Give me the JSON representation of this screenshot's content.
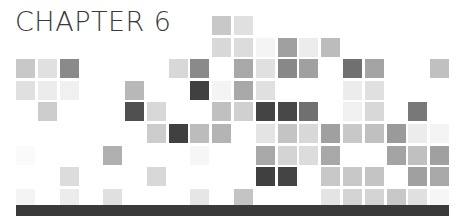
{
  "title": "CHAPTER 6",
  "bar_color": "#3a3a3a",
  "grid": {
    "origin_x": 16,
    "origin_y": 16,
    "pitch_x": 21.8,
    "pitch_y": 21.6,
    "columns": 20,
    "rows": 9,
    "cells": [
      {
        "r": 0,
        "c": 9,
        "color": "#c8c8c8"
      },
      {
        "r": 0,
        "c": 10,
        "color": "#e0e0e0"
      },
      {
        "r": 1,
        "c": 9,
        "color": "#d8d8d8"
      },
      {
        "r": 1,
        "c": 10,
        "color": "#dcdcdc"
      },
      {
        "r": 1,
        "c": 11,
        "color": "#f4f4f4"
      },
      {
        "r": 1,
        "c": 12,
        "color": "#a0a0a0"
      },
      {
        "r": 1,
        "c": 13,
        "color": "#ececec"
      },
      {
        "r": 1,
        "c": 14,
        "color": "#bcbcbc"
      },
      {
        "r": 2,
        "c": 0,
        "color": "#c8c8c8"
      },
      {
        "r": 2,
        "c": 1,
        "color": "#e0e0e0"
      },
      {
        "r": 2,
        "c": 2,
        "color": "#8a8a8a"
      },
      {
        "r": 2,
        "c": 7,
        "color": "#d8d8d8"
      },
      {
        "r": 2,
        "c": 8,
        "color": "#8a8a8a"
      },
      {
        "r": 2,
        "c": 10,
        "color": "#a8a8a8"
      },
      {
        "r": 2,
        "c": 11,
        "color": "#e0e0e0"
      },
      {
        "r": 2,
        "c": 12,
        "color": "#888888"
      },
      {
        "r": 2,
        "c": 13,
        "color": "#a0a0a0"
      },
      {
        "r": 2,
        "c": 15,
        "color": "#707070"
      },
      {
        "r": 2,
        "c": 16,
        "color": "#a4a4a4"
      },
      {
        "r": 2,
        "c": 19,
        "color": "#c0c0c0"
      },
      {
        "r": 3,
        "c": 0,
        "color": "#e0e0e0"
      },
      {
        "r": 3,
        "c": 1,
        "color": "#ececec"
      },
      {
        "r": 3,
        "c": 2,
        "color": "#f0f0f0"
      },
      {
        "r": 3,
        "c": 5,
        "color": "#b8b8b8"
      },
      {
        "r": 3,
        "c": 8,
        "color": "#404040"
      },
      {
        "r": 3,
        "c": 9,
        "color": "#f4f4f4"
      },
      {
        "r": 3,
        "c": 10,
        "color": "#a8a8a8"
      },
      {
        "r": 3,
        "c": 11,
        "color": "#e0e0e0"
      },
      {
        "r": 3,
        "c": 15,
        "color": "#ececec"
      },
      {
        "r": 3,
        "c": 16,
        "color": "#e0e0e0"
      },
      {
        "r": 4,
        "c": 1,
        "color": "#cccccc"
      },
      {
        "r": 4,
        "c": 5,
        "color": "#505050"
      },
      {
        "r": 4,
        "c": 6,
        "color": "#d8d8d8"
      },
      {
        "r": 4,
        "c": 9,
        "color": "#c0c0c0"
      },
      {
        "r": 4,
        "c": 10,
        "color": "#d0d0d0"
      },
      {
        "r": 4,
        "c": 11,
        "color": "#444444"
      },
      {
        "r": 4,
        "c": 12,
        "color": "#484848"
      },
      {
        "r": 4,
        "c": 13,
        "color": "#707070"
      },
      {
        "r": 4,
        "c": 15,
        "color": "#f0f0f0"
      },
      {
        "r": 4,
        "c": 16,
        "color": "#d8d8d8"
      },
      {
        "r": 4,
        "c": 18,
        "color": "#787878"
      },
      {
        "r": 5,
        "c": 6,
        "color": "#cccccc"
      },
      {
        "r": 5,
        "c": 7,
        "color": "#404040"
      },
      {
        "r": 5,
        "c": 8,
        "color": "#bcbcbc"
      },
      {
        "r": 5,
        "c": 9,
        "color": "#b4b4b4"
      },
      {
        "r": 5,
        "c": 11,
        "color": "#e4e4e4"
      },
      {
        "r": 5,
        "c": 12,
        "color": "#c4c4c4"
      },
      {
        "r": 5,
        "c": 13,
        "color": "#d8d8d8"
      },
      {
        "r": 5,
        "c": 14,
        "color": "#a0a0a0"
      },
      {
        "r": 5,
        "c": 15,
        "color": "#c8c8c8"
      },
      {
        "r": 5,
        "c": 16,
        "color": "#c0c0c0"
      },
      {
        "r": 5,
        "c": 17,
        "color": "#9a9a9a"
      },
      {
        "r": 5,
        "c": 18,
        "color": "#ececec"
      },
      {
        "r": 5,
        "c": 19,
        "color": "#f4f4f4"
      },
      {
        "r": 6,
        "c": 0,
        "color": "#fafafa"
      },
      {
        "r": 6,
        "c": 4,
        "color": "#b0b0b0"
      },
      {
        "r": 6,
        "c": 8,
        "color": "#f6f6f6"
      },
      {
        "r": 6,
        "c": 11,
        "color": "#a8a8a8"
      },
      {
        "r": 6,
        "c": 12,
        "color": "#d4d4d4"
      },
      {
        "r": 6,
        "c": 13,
        "color": "#dcdcdc"
      },
      {
        "r": 6,
        "c": 14,
        "color": "#a8a8a8"
      },
      {
        "r": 6,
        "c": 17,
        "color": "#a4a4a4"
      },
      {
        "r": 6,
        "c": 18,
        "color": "#c0c0c0"
      },
      {
        "r": 6,
        "c": 19,
        "color": "#a0a0a0"
      },
      {
        "r": 7,
        "c": 2,
        "color": "#dcdcdc"
      },
      {
        "r": 7,
        "c": 6,
        "color": "#d8d8d8"
      },
      {
        "r": 7,
        "c": 11,
        "color": "#404040"
      },
      {
        "r": 7,
        "c": 12,
        "color": "#444444"
      },
      {
        "r": 7,
        "c": 14,
        "color": "#c8c8c8"
      },
      {
        "r": 7,
        "c": 15,
        "color": "#c8c8c8"
      },
      {
        "r": 7,
        "c": 16,
        "color": "#c4c4c4"
      },
      {
        "r": 7,
        "c": 18,
        "color": "#a0a0a0"
      },
      {
        "r": 7,
        "c": 19,
        "color": "#a8a8a8"
      },
      {
        "r": 8,
        "c": 0,
        "color": "#f4f4f4"
      },
      {
        "r": 8,
        "c": 2,
        "color": "#ececec"
      },
      {
        "r": 8,
        "c": 4,
        "color": "#e0e0e0"
      },
      {
        "r": 8,
        "c": 8,
        "color": "#e6e6e6"
      },
      {
        "r": 8,
        "c": 10,
        "color": "#c4c4c4"
      },
      {
        "r": 8,
        "c": 14,
        "color": "#e4e4e4"
      },
      {
        "r": 8,
        "c": 15,
        "color": "#d4d4d4"
      },
      {
        "r": 8,
        "c": 16,
        "color": "#d4d4d4"
      },
      {
        "r": 8,
        "c": 17,
        "color": "#c8c8c8"
      },
      {
        "r": 8,
        "c": 18,
        "color": "#e0e0e0"
      },
      {
        "r": 8,
        "c": 19,
        "color": "#f6f6f6"
      }
    ]
  }
}
